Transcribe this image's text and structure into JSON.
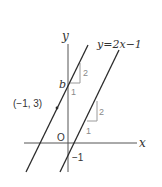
{
  "diagram": {
    "type": "coordinate-plane-lines",
    "axes": {
      "x_label": "x",
      "y_label": "y",
      "origin_label": "O"
    },
    "lines": [
      {
        "id": "given-line",
        "equation_label": "y=2x−1",
        "slope": 2,
        "y_intercept": -1,
        "intercept_label": "−1"
      },
      {
        "id": "parallel-line",
        "slope": 2,
        "y_intercept_label": "b",
        "passes_through_label": "(−1, 3)"
      }
    ],
    "slope_triangles": [
      {
        "run_label": "1",
        "rise_label": "2"
      },
      {
        "run_label": "1",
        "rise_label": "2"
      }
    ],
    "colors": {
      "line": "#2b2b2b",
      "axis": "#555555",
      "triangle": "#9a9a9a",
      "label": "#333333",
      "triangle_label": "#8a8a8a"
    }
  }
}
